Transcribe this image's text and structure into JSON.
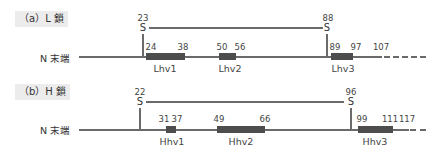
{
  "panels": [
    {
      "id": "a",
      "label": "（a）L 鎖",
      "terminus_label": "N 末端",
      "disulfide": {
        "left": {
          "residue": "23",
          "symbol": "S"
        },
        "right": {
          "residue": "88",
          "symbol": "S"
        }
      },
      "regions": [
        {
          "name": "Lhv1",
          "start": "24",
          "end": "38"
        },
        {
          "name": "Lhv2",
          "start": "50",
          "end": "56"
        },
        {
          "name": "Lhv3",
          "start": "89",
          "end": "97"
        }
      ],
      "chain_end": "107"
    },
    {
      "id": "b",
      "label": "（b）H 鎖",
      "terminus_label": "N 末端",
      "disulfide": {
        "left": {
          "residue": "22",
          "symbol": "S"
        },
        "right": {
          "residue": "96",
          "symbol": "S"
        }
      },
      "regions": [
        {
          "name": "Hhv1",
          "start": "31",
          "end": "37"
        },
        {
          "name": "Hhv2",
          "start": "49",
          "end": "66"
        },
        {
          "name": "Hhv3",
          "start": "99",
          "end": "111"
        }
      ],
      "chain_end": "117"
    }
  ],
  "colors": {
    "backbone": "#6a6a6a",
    "region_box": "#4d4d4d",
    "label_bg": "#ececec"
  }
}
